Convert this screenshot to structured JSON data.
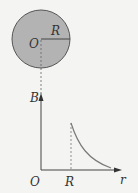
{
  "figure": {
    "labels": {
      "center": "O",
      "radius": "R",
      "y_axis": "B",
      "origin": "O",
      "x_tick": "R",
      "x_axis": "r"
    },
    "colors": {
      "disk_fill": "#b3b3b3",
      "stroke": "#555555",
      "curve": "#7a7a7a",
      "background": "#f4f4f2"
    }
  }
}
